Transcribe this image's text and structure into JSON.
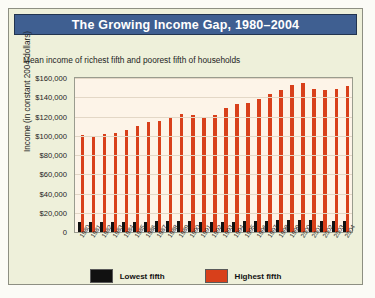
{
  "title": "The Growing Income Gap, 1980–2004",
  "subtitle": "Mean income of richest fifth and poorest fifth of households",
  "colors": {
    "header_bg": "#3f5f91",
    "panel_bg": "#eef0da",
    "plot_bg": "#fdf4e8",
    "lowest": "#111111",
    "highest": "#d8401b"
  },
  "legend": {
    "items": [
      {
        "label": "Lowest fifth",
        "color": "#111111"
      },
      {
        "label": "Highest fifth",
        "color": "#d8401b"
      }
    ]
  },
  "chart_data": {
    "type": "bar",
    "title": "The Growing Income Gap, 1980–2004",
    "subtitle": "Mean income of richest fifth and poorest fifth of households",
    "xlabel": "",
    "ylabel": "Income (in constant 2004 dollars)",
    "ylim": [
      0,
      160000
    ],
    "ytick_step": 20000,
    "yticks": [
      160000,
      140000,
      120000,
      100000,
      80000,
      60000,
      40000,
      20000,
      0
    ],
    "ytick_labels": [
      "$160,000",
      "$140,000",
      "$120,000",
      "$100,000",
      "$80,000",
      "$60,000",
      "$40,000",
      "$20,000",
      "0"
    ],
    "grid": true,
    "legend_position": "bottom",
    "categories": [
      "1980",
      "1981",
      "1982",
      "1983",
      "1984",
      "1985",
      "1986",
      "1987",
      "1988",
      "1989",
      "1990",
      "1991",
      "1992",
      "1993",
      "1994",
      "1995",
      "1996",
      "1997",
      "1998",
      "1999",
      "2000",
      "2001",
      "2002",
      "2003",
      "2004"
    ],
    "series": [
      {
        "name": "Lowest fifth",
        "color": "#111111",
        "values": [
          10700,
          10300,
          10100,
          10100,
          10400,
          10600,
          10900,
          11200,
          11300,
          11500,
          11200,
          10600,
          10500,
          10300,
          10700,
          11100,
          11300,
          11600,
          12000,
          12400,
          12500,
          12200,
          11900,
          11800,
          11900
        ]
      },
      {
        "name": "Highest fifth",
        "color": "#d8401b",
        "values": [
          100900,
          100200,
          101500,
          103000,
          106500,
          109800,
          114000,
          115500,
          118600,
          122800,
          121500,
          119000,
          121800,
          128500,
          133300,
          134100,
          137800,
          143000,
          147400,
          152900,
          155000,
          148800,
          147200,
          148400,
          151600
        ]
      }
    ]
  }
}
